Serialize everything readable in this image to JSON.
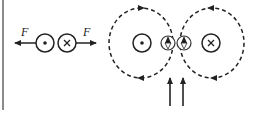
{
  "diagram": {
    "left_panel": {
      "force_label_left": "F",
      "force_label_right": "F",
      "wire_left": {
        "symbol": "dot",
        "meaning": "current out of page"
      },
      "wire_right": {
        "symbol": "cross",
        "meaning": "current into page"
      }
    },
    "right_panel": {
      "wire_left": {
        "symbol": "dot",
        "meaning": "current out of page"
      },
      "wire_right": {
        "symbol": "cross",
        "meaning": "current into page"
      },
      "field_loops": [
        "left loop counterclockwise",
        "right loop clockwise"
      ],
      "compasses": [
        {
          "position": "left-center",
          "needle": "up"
        },
        {
          "position": "right-center",
          "needle": "up"
        }
      ],
      "arrows_below": [
        "up",
        "up"
      ]
    },
    "colors": {
      "stroke": "#222222",
      "border": "#8a8a8a",
      "background": "#ffffff"
    }
  }
}
